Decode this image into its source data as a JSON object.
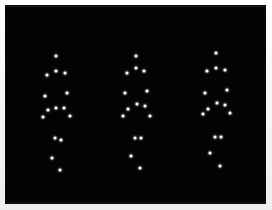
{
  "display": {
    "title": "Point-Light Biological Motion Display",
    "background_color": "#030303",
    "dot_color": "#fdfdfd",
    "border_color": "#f4f4f2",
    "field": {
      "x": 6,
      "y": 6,
      "width": 259,
      "height": 197
    },
    "dot_diameter_px": 3,
    "figure_count": 3,
    "dots_per_figure": 15
  },
  "figures": [
    {
      "name": "walker-left",
      "label": "Figure 1",
      "dots": [
        {
          "name": "head",
          "x": 56,
          "y": 56
        },
        {
          "name": "left-shoulder",
          "x": 47,
          "y": 75
        },
        {
          "name": "sternum",
          "x": 56,
          "y": 71
        },
        {
          "name": "right-shoulder",
          "x": 65,
          "y": 73
        },
        {
          "name": "left-elbow",
          "x": 45,
          "y": 96
        },
        {
          "name": "right-elbow",
          "x": 67,
          "y": 93
        },
        {
          "name": "left-hip",
          "x": 48,
          "y": 110
        },
        {
          "name": "pelvis",
          "x": 56,
          "y": 108
        },
        {
          "name": "right-hip",
          "x": 64,
          "y": 108
        },
        {
          "name": "left-wrist",
          "x": 43,
          "y": 117
        },
        {
          "name": "right-wrist",
          "x": 70,
          "y": 116
        },
        {
          "name": "left-knee",
          "x": 55,
          "y": 138
        },
        {
          "name": "right-knee",
          "x": 61,
          "y": 140
        },
        {
          "name": "left-ankle",
          "x": 52,
          "y": 158
        },
        {
          "name": "right-ankle",
          "x": 60,
          "y": 170
        }
      ]
    },
    {
      "name": "walker-center",
      "label": "Figure 2",
      "dots": [
        {
          "name": "head",
          "x": 136,
          "y": 56
        },
        {
          "name": "left-shoulder",
          "x": 127,
          "y": 73
        },
        {
          "name": "sternum",
          "x": 136,
          "y": 68
        },
        {
          "name": "right-shoulder",
          "x": 144,
          "y": 71
        },
        {
          "name": "left-elbow",
          "x": 125,
          "y": 93
        },
        {
          "name": "right-elbow",
          "x": 147,
          "y": 91
        },
        {
          "name": "left-hip",
          "x": 128,
          "y": 109
        },
        {
          "name": "pelvis",
          "x": 137,
          "y": 104
        },
        {
          "name": "right-hip",
          "x": 145,
          "y": 106
        },
        {
          "name": "left-wrist",
          "x": 123,
          "y": 116
        },
        {
          "name": "right-wrist",
          "x": 150,
          "y": 116
        },
        {
          "name": "left-knee",
          "x": 135,
          "y": 138
        },
        {
          "name": "right-knee",
          "x": 141,
          "y": 138
        },
        {
          "name": "left-ankle",
          "x": 131,
          "y": 156
        },
        {
          "name": "right-ankle",
          "x": 140,
          "y": 168
        }
      ]
    },
    {
      "name": "walker-right",
      "label": "Figure 3",
      "dots": [
        {
          "name": "head",
          "x": 216,
          "y": 53
        },
        {
          "name": "left-shoulder",
          "x": 207,
          "y": 71
        },
        {
          "name": "sternum",
          "x": 216,
          "y": 68
        },
        {
          "name": "right-shoulder",
          "x": 225,
          "y": 70
        },
        {
          "name": "left-elbow",
          "x": 205,
          "y": 93
        },
        {
          "name": "right-elbow",
          "x": 227,
          "y": 90
        },
        {
          "name": "left-hip",
          "x": 208,
          "y": 109
        },
        {
          "name": "pelvis",
          "x": 217,
          "y": 103
        },
        {
          "name": "right-hip",
          "x": 225,
          "y": 105
        },
        {
          "name": "left-wrist",
          "x": 203,
          "y": 114
        },
        {
          "name": "right-wrist",
          "x": 230,
          "y": 113
        },
        {
          "name": "left-knee",
          "x": 215,
          "y": 137
        },
        {
          "name": "right-knee",
          "x": 221,
          "y": 137
        },
        {
          "name": "left-ankle",
          "x": 210,
          "y": 153
        },
        {
          "name": "right-ankle",
          "x": 220,
          "y": 166
        }
      ]
    }
  ]
}
